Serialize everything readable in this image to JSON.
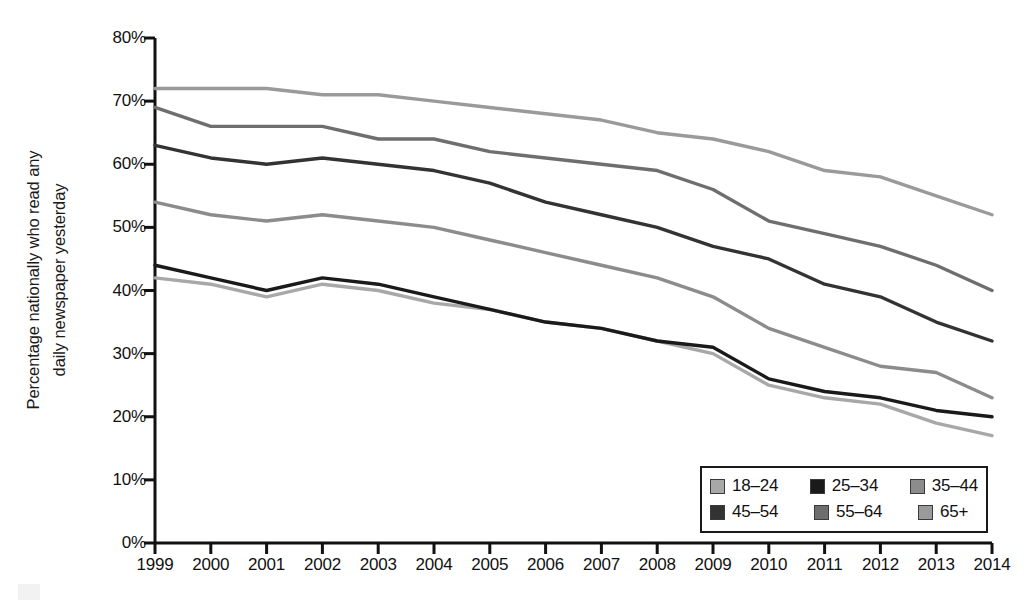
{
  "chart_data": {
    "type": "line",
    "title": "",
    "xlabel": "",
    "ylabel": "Percentage nationally who read any daily newspaper yesterday",
    "ylabel_lines": [
      "Percentage nationally who read any",
      "daily newspaper yesterday"
    ],
    "ylim": [
      0,
      80
    ],
    "ytick_labels": [
      "0%",
      "10%",
      "20%",
      "30%",
      "40%",
      "50%",
      "60%",
      "70%",
      "80%"
    ],
    "ytick_values": [
      0,
      10,
      20,
      30,
      40,
      50,
      60,
      70,
      80
    ],
    "grid": false,
    "legend_position": "bottom-right",
    "x": [
      1999,
      2000,
      2001,
      2002,
      2003,
      2004,
      2005,
      2006,
      2007,
      2008,
      2009,
      2010,
      2011,
      2012,
      2013,
      2014
    ],
    "categories": [
      "1999",
      "2000",
      "2001",
      "2002",
      "2003",
      "2004",
      "2005",
      "2006",
      "2007",
      "2008",
      "2009",
      "2010",
      "2011",
      "2012",
      "2013",
      "2014"
    ],
    "series": [
      {
        "name": "18–24",
        "color": "#a8a8a8",
        "values": [
          42,
          41,
          39,
          41,
          40,
          38,
          37,
          35,
          34,
          32,
          30,
          25,
          23,
          22,
          19,
          17
        ]
      },
      {
        "name": "25–34",
        "color": "#1a1a1a",
        "values": [
          44,
          42,
          40,
          42,
          41,
          39,
          37,
          35,
          34,
          32,
          31,
          26,
          24,
          23,
          21,
          20
        ]
      },
      {
        "name": "35–44",
        "color": "#8c8c8c",
        "values": [
          54,
          52,
          51,
          52,
          51,
          50,
          48,
          46,
          44,
          42,
          39,
          34,
          31,
          28,
          27,
          23
        ]
      },
      {
        "name": "45–54",
        "color": "#333333",
        "values": [
          63,
          61,
          60,
          61,
          60,
          59,
          57,
          54,
          52,
          50,
          47,
          45,
          41,
          39,
          35,
          32
        ]
      },
      {
        "name": "55–64",
        "color": "#6e6e6e",
        "values": [
          69,
          66,
          66,
          66,
          64,
          64,
          62,
          61,
          60,
          59,
          56,
          51,
          49,
          47,
          44,
          40
        ]
      },
      {
        "name": "65+",
        "color": "#9a9a9a",
        "values": [
          72,
          72,
          72,
          71,
          71,
          70,
          69,
          68,
          67,
          65,
          64,
          62,
          59,
          58,
          55,
          52
        ]
      }
    ]
  },
  "legend": {
    "rows": [
      [
        {
          "label": "18–24",
          "color": "#a8a8a8"
        },
        {
          "label": "25–34",
          "color": "#1a1a1a"
        },
        {
          "label": "35–44",
          "color": "#8c8c8c"
        }
      ],
      [
        {
          "label": "45–54",
          "color": "#333333"
        },
        {
          "label": "55–64",
          "color": "#6e6e6e"
        },
        {
          "label": "65+",
          "color": "#9a9a9a"
        }
      ]
    ]
  },
  "axis_colors": {
    "axis_line": "#111111"
  }
}
